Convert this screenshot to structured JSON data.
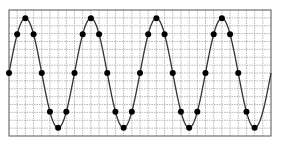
{
  "chart_data": {
    "type": "line",
    "title": "",
    "xlabel": "",
    "ylabel": "",
    "grid": true,
    "grid_columns": 32,
    "grid_rows": 16,
    "legend": null,
    "xlim": [
      0,
      1440
    ],
    "ylim": [
      -1.15,
      1.15
    ],
    "x_unit": "degrees",
    "series": [
      {
        "name": "sine",
        "marker_x": [
          0,
          45,
          90,
          135,
          180,
          225,
          270,
          315,
          360,
          405,
          450,
          495,
          540,
          585,
          630,
          675,
          720,
          765,
          810,
          855,
          900,
          945,
          990,
          1035,
          1080,
          1125,
          1170,
          1215,
          1260,
          1305,
          1350
        ],
        "marker_y": [
          0,
          0.707,
          1,
          0.707,
          0,
          -0.707,
          -1,
          -0.707,
          0,
          0.707,
          1,
          0.707,
          0,
          -0.707,
          -1,
          -0.707,
          0,
          0.707,
          1,
          0.707,
          0,
          -0.707,
          -1,
          -0.707,
          0,
          0.707,
          1,
          0.707,
          0,
          -0.707,
          -1
        ],
        "curve_color": "#333333",
        "marker_color": "#000000"
      }
    ]
  },
  "colors": {
    "background": "#ffffff",
    "frame": "#555555",
    "grid": "#9a9a9a"
  }
}
